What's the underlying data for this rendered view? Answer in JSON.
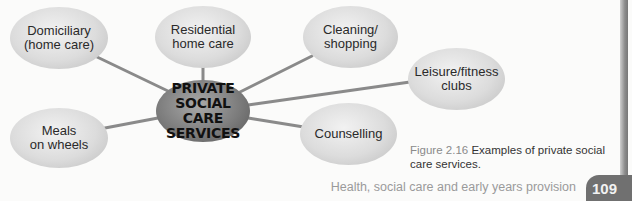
{
  "diagram": {
    "type": "mind-map",
    "center": {
      "label": "PRIVATE\nSOCIAL CARE\nSERVICES"
    },
    "nodes": [
      {
        "id": "domiciliary",
        "label": "Domiciliary\n(home care)"
      },
      {
        "id": "residential",
        "label": "Residential\nhome care"
      },
      {
        "id": "cleaning",
        "label": "Cleaning/\nshopping"
      },
      {
        "id": "leisure",
        "label": "Leisure/fitness\nclubs"
      },
      {
        "id": "counselling",
        "label": "Counselling"
      },
      {
        "id": "meals",
        "label": "Meals\non wheels"
      }
    ],
    "connector_color": "#8a8a8a"
  },
  "caption": {
    "figure_number": "Figure 2.16",
    "text": "Examples of private social care services."
  },
  "footer": {
    "running_title": "Health, social care and early years provision",
    "page_number": "109"
  }
}
